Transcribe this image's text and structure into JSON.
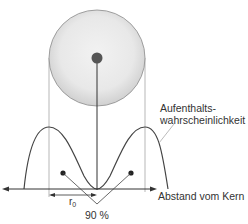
{
  "diagram": {
    "labels": {
      "probability_line1": "Aufenthalts-",
      "probability_line2": "wahrscheinlichkeit",
      "axis": "Abstand vom Kern",
      "radius_symbol": "r",
      "radius_subscript": "0",
      "percentage": "90 %"
    },
    "colors": {
      "line": "#444444",
      "guide": "#888888",
      "sphere_fill": "#e6e6e6",
      "sphere_edge": "#8a8a8a",
      "nucleus": "#555555",
      "text": "#333333"
    }
  }
}
